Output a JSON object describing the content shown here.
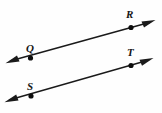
{
  "figure": {
    "type": "geometry-diagram",
    "canvas": {
      "width": 162,
      "height": 113,
      "background": "#fefefe"
    },
    "stroke_color": "#1a1a1a",
    "point_color": "#0d0d0d",
    "label_color": "#141414",
    "lines": [
      {
        "name": "line-QR",
        "label": "QR",
        "from": {
          "x": 6,
          "y": 62
        },
        "to": {
          "x": 155,
          "y": 21
        },
        "arrow_start": true,
        "arrow_end": true,
        "points": [
          {
            "label": "Q",
            "x": 30,
            "y": 58,
            "label_x": 26,
            "label_y": 43
          },
          {
            "label": "R",
            "x": 131,
            "y": 27,
            "label_x": 126,
            "label_y": 9
          }
        ]
      },
      {
        "name": "line-ST",
        "label": "ST",
        "from": {
          "x": 5,
          "y": 101
        },
        "to": {
          "x": 153,
          "y": 59
        },
        "arrow_start": true,
        "arrow_end": true,
        "points": [
          {
            "label": "S",
            "x": 31,
            "y": 96,
            "label_x": 27,
            "label_y": 81
          },
          {
            "label": "T",
            "x": 131,
            "y": 65,
            "label_x": 127,
            "label_y": 47
          }
        ]
      }
    ],
    "labels": {
      "q": "Q",
      "r": "R",
      "s": "S",
      "t": "T"
    }
  }
}
